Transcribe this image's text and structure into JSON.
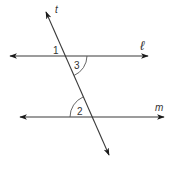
{
  "diagram": {
    "type": "parallel-lines-transversal",
    "colors": {
      "line": "#3a3a3a",
      "label": "#333333",
      "background": "#ffffff"
    },
    "lines": [
      {
        "id": "l",
        "label": "ℓ",
        "x1": 8,
        "y1": 56,
        "x2": 150,
        "y2": 56,
        "arrows": "both"
      },
      {
        "id": "m",
        "label": "m",
        "x1": 18,
        "y1": 117,
        "x2": 165,
        "y2": 117,
        "arrows": "both"
      },
      {
        "id": "t",
        "label": "t",
        "x1": 45,
        "y1": 10,
        "x2": 110,
        "y2": 156,
        "arrows": "both"
      }
    ],
    "angles": [
      {
        "id": "1",
        "label": "1",
        "position": "above ℓ, left of t",
        "marked": false
      },
      {
        "id": "3",
        "label": "3",
        "position": "below ℓ, right of t",
        "marked": true
      },
      {
        "id": "2",
        "label": "2",
        "position": "above m, left of t",
        "marked": true
      }
    ],
    "labels": {
      "t": "t",
      "l": "ℓ",
      "m": "m",
      "angle1": "1",
      "angle2": "2",
      "angle3": "3"
    }
  }
}
